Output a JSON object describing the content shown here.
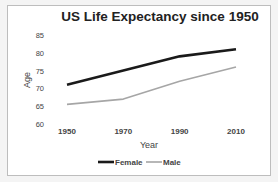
{
  "chart_data": {
    "type": "line",
    "title": "US Life Expectancy since 1950",
    "xlabel": "Year",
    "ylabel": "Age",
    "x": [
      1950,
      1970,
      1990,
      2010
    ],
    "x_tick_labels": [
      "1950",
      "1970",
      "1990",
      "2010"
    ],
    "y_tick_labels": [
      "60",
      "65",
      "70",
      "75",
      "80",
      "85"
    ],
    "ylim": [
      60,
      85
    ],
    "grid": false,
    "legend_position": "bottom",
    "series": [
      {
        "name": "Female",
        "values": [
          71,
          75,
          79,
          81
        ],
        "color": "#1a1a1a"
      },
      {
        "name": "Male",
        "values": [
          65.5,
          67,
          72,
          76
        ],
        "color": "#a6a6a6"
      }
    ]
  }
}
